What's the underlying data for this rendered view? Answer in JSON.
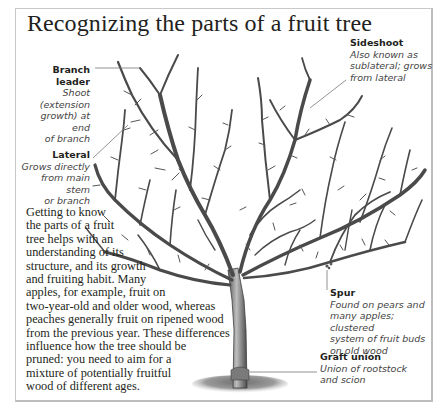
{
  "title": "Recognizing the parts of a fruit tree",
  "labels": {
    "branch_leader": {
      "heading": "Branch leader",
      "description_lines": [
        "Shoot (extension",
        "growth) at end",
        "of branch"
      ]
    },
    "sideshoot": {
      "heading": "Sideshoot",
      "description_lines": [
        "Also known as",
        "sublateral; grows",
        "from lateral"
      ]
    },
    "lateral": {
      "heading": "Lateral",
      "description_lines": [
        "Grows directly",
        "from main stem",
        "or branch"
      ]
    },
    "spur": {
      "heading": "Spur",
      "description_lines": [
        "Found on pears and",
        "many apples; clustered",
        "system of fruit buds",
        "on old wood"
      ]
    },
    "graft_union": {
      "heading": "Graft union",
      "description_lines": [
        "Union of rootstock",
        "and scion"
      ]
    }
  },
  "body_text_lines": [
    "Getting to know",
    "the parts of a fruit",
    "tree helps with an",
    "understanding of its",
    "structure, and its growth",
    "and fruiting habit. Many",
    "apples, for example, fruit on",
    "two-year-old and older wood, whereas",
    "peaches generally fruit on ripened wood",
    "from the previous year. These differences",
    "influence how the tree should be",
    "pruned: you need to aim for a",
    "mixture of potentially fruitful",
    "wood of different ages."
  ],
  "colors": {
    "frame_border": "#c9c9c9",
    "text": "#231f20",
    "branch": "#4a4a4a",
    "leader_line": "#777777",
    "ground": "#8a8a8a"
  }
}
